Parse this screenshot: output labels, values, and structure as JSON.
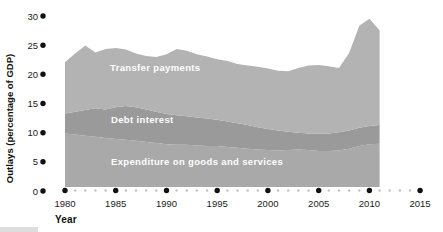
{
  "figure": {
    "y_axis_title": "Outlays (percentage of GDP)",
    "x_axis_title": "Year"
  },
  "area_labels": {
    "transfer": "Transfer payments",
    "debt": "Debt interest",
    "expenditure": "Expenditure on goods and services"
  },
  "colors": {
    "transfer_area": "#b3b3b3",
    "debt_area": "#9a9a9a",
    "expenditure_area": "#a9a9a9",
    "major_dot": "#111111",
    "minor_dot": "#c3c3c3",
    "label_text": "#ffffff",
    "axis_text": "#1b1b1b"
  },
  "chart_data": {
    "type": "area",
    "stacked": true,
    "title": "",
    "xlabel": "Year",
    "ylabel": "Outlays (percentage of GDP)",
    "ylim": [
      0,
      30
    ],
    "y_ticks": [
      0,
      5,
      10,
      15,
      20,
      25,
      30
    ],
    "x_ticks_major": [
      1980,
      1985,
      1990,
      1995,
      2000,
      2005,
      2010,
      2015
    ],
    "x_axis_span": [
      1980,
      2015
    ],
    "x_minor_ticks": "every year between major ticks shown as small gray dots",
    "grid": false,
    "legend": "series labels printed inside areas",
    "axis_style": "dotted axes (black dots at labeled ticks)",
    "x": [
      1980,
      1981,
      1982,
      1983,
      1984,
      1985,
      1986,
      1987,
      1988,
      1989,
      1990,
      1991,
      1992,
      1993,
      1994,
      1995,
      1996,
      1997,
      1998,
      1999,
      2000,
      2001,
      2002,
      2003,
      2004,
      2005,
      2006,
      2007,
      2008,
      2009,
      2010,
      2011
    ],
    "series": [
      {
        "name": "Expenditure on goods and services",
        "color": "#a9a9a9",
        "values": [
          9.4,
          9.2,
          9.0,
          8.8,
          8.6,
          8.4,
          8.3,
          8.1,
          7.9,
          7.7,
          7.5,
          7.4,
          7.4,
          7.3,
          7.2,
          7.2,
          7.0,
          6.9,
          6.7,
          6.6,
          6.5,
          6.4,
          6.5,
          6.6,
          6.5,
          6.3,
          6.3,
          6.4,
          6.7,
          7.2,
          7.5,
          7.6
        ]
      },
      {
        "name": "Debt interest",
        "color": "#9a9a9a",
        "values": [
          3.5,
          4.0,
          4.5,
          5.0,
          5.0,
          5.6,
          5.9,
          5.9,
          5.7,
          5.5,
          5.3,
          5.2,
          5.0,
          4.9,
          4.8,
          4.6,
          4.5,
          4.3,
          4.2,
          3.9,
          3.7,
          3.5,
          3.2,
          2.9,
          2.9,
          3.1,
          3.1,
          3.2,
          3.2,
          3.2,
          3.2,
          3.3
        ]
      },
      {
        "name": "Transfer payments",
        "color": "#b3b3b3",
        "values": [
          9.0,
          10.2,
          11.3,
          9.8,
          10.6,
          10.4,
          9.9,
          9.4,
          9.4,
          9.6,
          10.5,
          11.6,
          11.5,
          11.1,
          10.9,
          10.6,
          10.6,
          10.4,
          10.4,
          10.6,
          10.6,
          10.5,
          10.6,
          11.4,
          11.9,
          12.0,
          11.8,
          11.3,
          13.6,
          17.9,
          18.8,
          16.6
        ]
      }
    ],
    "stacked_totals_note": "top boundary = sum of three series; total rises from ~22 (1980) to ~24.8 (1982), dips, ~24.4 (1985), ~23 (1989), bump ~24.2 (1991), declines to ~20.3 (2002), ~21.4 (2005), spikes to ~29.5 (2010), ends ~27.5 (2011)"
  }
}
